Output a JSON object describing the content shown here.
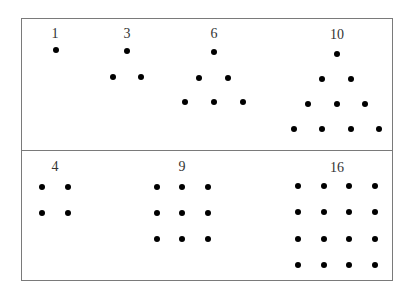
{
  "colors": {
    "line": "#7a7a7a",
    "dot": "#000000",
    "label": "#333333",
    "background": "#ffffff"
  },
  "frame": {
    "left": 21,
    "top": 18,
    "right": 393,
    "bottom": 281,
    "divider_y": 150
  },
  "rows": [
    {
      "name": "triangular-numbers",
      "groups": [
        {
          "label": "1",
          "label_pos": [
            55,
            34
          ],
          "dots": [
            [
              56,
              50
            ]
          ]
        },
        {
          "label": "3",
          "label_pos": [
            127,
            34
          ],
          "dots": [
            [
              127,
              51
            ],
            [
              113,
              77
            ],
            [
              141,
              77
            ]
          ]
        },
        {
          "label": "6",
          "label_pos": [
            214,
            34
          ],
          "dots": [
            [
              214,
              52
            ],
            [
              199,
              78
            ],
            [
              228,
              78
            ],
            [
              185,
              102
            ],
            [
              214,
              102
            ],
            [
              243,
              102
            ]
          ]
        },
        {
          "label": "10",
          "label_pos": [
            337,
            35
          ],
          "dots": [
            [
              337,
              54
            ],
            [
              322,
              79
            ],
            [
              351,
              79
            ],
            [
              308,
              104
            ],
            [
              337,
              104
            ],
            [
              365,
              104
            ],
            [
              294,
              129
            ],
            [
              322,
              129
            ],
            [
              351,
              129
            ],
            [
              379,
              129
            ]
          ]
        }
      ]
    },
    {
      "name": "square-numbers",
      "groups": [
        {
          "label": "4",
          "label_pos": [
            55,
            167
          ],
          "dots": [
            [
              42,
              187
            ],
            [
              68,
              187
            ],
            [
              42,
              213
            ],
            [
              68,
              213
            ]
          ]
        },
        {
          "label": "9",
          "label_pos": [
            182,
            167
          ],
          "dots": [
            [
              157,
              187
            ],
            [
              182,
              187
            ],
            [
              208,
              187
            ],
            [
              157,
              213
            ],
            [
              182,
              213
            ],
            [
              208,
              213
            ],
            [
              157,
              239
            ],
            [
              182,
              239
            ],
            [
              208,
              239
            ]
          ]
        },
        {
          "label": "16",
          "label_pos": [
            337,
            168
          ],
          "dots": [
            [
              298,
              186
            ],
            [
              324,
              186
            ],
            [
              349,
              186
            ],
            [
              375,
              186
            ],
            [
              298,
              212
            ],
            [
              324,
              212
            ],
            [
              349,
              212
            ],
            [
              375,
              212
            ],
            [
              298,
              239
            ],
            [
              324,
              239
            ],
            [
              349,
              239
            ],
            [
              375,
              239
            ],
            [
              298,
              265
            ],
            [
              324,
              265
            ],
            [
              349,
              265
            ],
            [
              375,
              265
            ]
          ]
        }
      ]
    }
  ]
}
